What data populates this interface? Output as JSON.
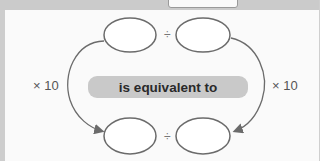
{
  "diagram": {
    "center_label": "is equivalent to",
    "left_operation": "× 10",
    "right_operation": "× 10",
    "top_expression": {
      "operator": "÷",
      "left_blank": "",
      "right_blank": ""
    },
    "bottom_expression": {
      "operator": "÷",
      "left_blank": "",
      "right_blank": ""
    }
  },
  "colors": {
    "outline": "#6b6b6b",
    "pill": "#c9c9c9",
    "background": "#fafafa"
  }
}
